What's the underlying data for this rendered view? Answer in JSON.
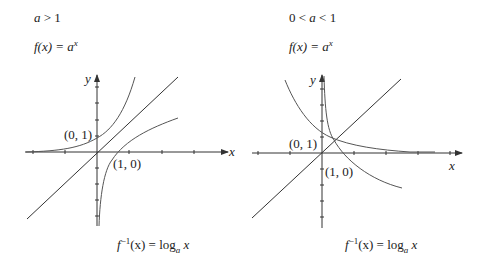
{
  "panels": [
    {
      "condition": {
        "a": "a",
        "op": " > 1"
      },
      "function": {
        "lhs": "f(x) = ",
        "base": "a",
        "exp": "x"
      },
      "inverse": {
        "lhs": "f",
        "sup": "−1",
        "arg": "(x) = log",
        "sub": "a",
        "var": " x"
      },
      "axes": {
        "x_label": "x",
        "y_label": "y"
      },
      "points": [
        {
          "label": "(0, 1)"
        },
        {
          "label": "(1, 0)"
        }
      ]
    },
    {
      "condition": {
        "prefix": "0 < ",
        "a": "a",
        "op": " < 1"
      },
      "function": {
        "lhs": "f(x) = ",
        "base": "a",
        "exp": "x"
      },
      "inverse": {
        "lhs": "f",
        "sup": "−1",
        "arg": "(x) = log",
        "sub": "a",
        "var": " x"
      },
      "axes": {
        "x_label": "x",
        "y_label": "y"
      },
      "points": [
        {
          "label": "(0, 1)"
        },
        {
          "label": "(1, 0)"
        }
      ]
    }
  ]
}
